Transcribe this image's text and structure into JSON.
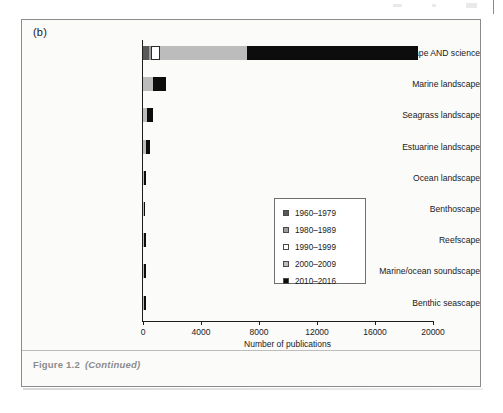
{
  "figure": {
    "panel_label": "(b)",
    "caption_prefix": "Figure 1.2",
    "caption_continued": "(Continued)"
  },
  "chart_data": {
    "type": "bar",
    "orientation": "horizontal",
    "stacked": true,
    "title": "",
    "xlabel": "Number of publications",
    "ylabel": "",
    "xlim": [
      0,
      20000
    ],
    "xticks": [
      0,
      4000,
      8000,
      12000,
      16000,
      20000
    ],
    "xticklabels": [
      "0",
      "4000",
      "8000",
      "12000",
      "16000",
      "20000"
    ],
    "grid": false,
    "legend_position": "center-right",
    "categories": [
      "Seascape AND science",
      "Marine landscape",
      "Seagrass landscape",
      "Estuarine landscape",
      "Ocean landscape",
      "Benthoscape",
      "Reefscape",
      "Marine/ocean soundscape",
      "Benthic seascape"
    ],
    "series": [
      {
        "name": "1960–1979",
        "color": "#595959",
        "values": [
          400,
          0,
          0,
          0,
          0,
          0,
          0,
          0,
          0
        ]
      },
      {
        "name": "1980–1989",
        "color": "#9d9d9d",
        "values": [
          150,
          0,
          0,
          0,
          0,
          0,
          0,
          0,
          0
        ]
      },
      {
        "name": "1990–1999",
        "color": "#ffffff",
        "values": [
          600,
          0,
          0,
          0,
          0,
          0,
          0,
          0,
          0
        ]
      },
      {
        "name": "2000–2009",
        "color": "#bcbcbc",
        "values": [
          6000,
          700,
          250,
          180,
          60,
          40,
          40,
          40,
          40
        ]
      },
      {
        "name": "2010–2016",
        "color": "#0d0d0d",
        "values": [
          11850,
          900,
          420,
          330,
          180,
          110,
          160,
          140,
          150
        ]
      }
    ],
    "totals": [
      19000,
      1600,
      670,
      510,
      240,
      150,
      200,
      180,
      190
    ]
  },
  "legend": {
    "entries": [
      {
        "label": "1960–1979",
        "color": "#595959"
      },
      {
        "label": "1980–1989",
        "color": "#9d9d9d"
      },
      {
        "label": "1990–1999",
        "color": "#ffffff"
      },
      {
        "label": "2000–2009",
        "color": "#bcbcbc"
      },
      {
        "label": "2010–2016",
        "color": "#0d0d0d"
      }
    ]
  }
}
